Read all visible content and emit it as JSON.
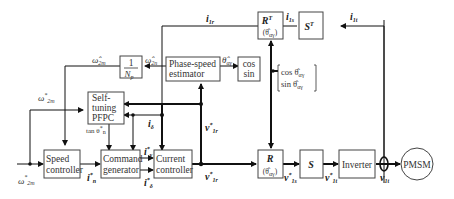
{
  "blocks": {
    "inv_np": {
      "num": "1",
      "den": "N",
      "den_sub": "p"
    },
    "phase_speed": {
      "line1": "Phase-speed",
      "line2": "estimator"
    },
    "cos_sin": {
      "line1": "cos",
      "line2": "sin"
    },
    "rt": {
      "main": "R",
      "sup": "T",
      "arg": "(θ̂",
      "arg_sub": "αγ",
      "arg_close": ")"
    },
    "st": {
      "main": "S",
      "sup": "T"
    },
    "self_tuning": {
      "line1": "Self-",
      "line2": "tuning",
      "line3": "PFPC"
    },
    "speed_ctrl": {
      "line1": "Speed",
      "line2": "controller"
    },
    "cmd_gen": {
      "line1": "Command",
      "line2": "generator"
    },
    "cur_ctrl": {
      "line1": "Current",
      "line2": "controller"
    },
    "r": {
      "main": "R",
      "arg": "(θ̂",
      "arg_sub": "αγ",
      "arg_close": ")"
    },
    "s": {
      "main": "S"
    },
    "inverter": {
      "label": "Inverter"
    },
    "pmsm": {
      "label": "PMSM"
    }
  },
  "signals": {
    "i1r_top": {
      "main": "i",
      "sub": "1r"
    },
    "i1s_top": {
      "main": "i",
      "sub": "1s"
    },
    "i1t_top": {
      "main": "i",
      "sub": "1t"
    },
    "w2m_hat": {
      "main": "ω̂",
      "sub": "2m"
    },
    "w2n_hat": {
      "main": "ω̂",
      "sub": "2n"
    },
    "theta_hat": {
      "main": "θ̂",
      "sub": "αγ"
    },
    "w2m_star_upper": {
      "main": "ω",
      "sup": "*",
      "sub": "2m"
    },
    "w2m_star_lower": {
      "main": "ω",
      "sup": "*",
      "sub": "2m"
    },
    "cos_vec": {
      "line1": "cos θ̂",
      "line1_sub": "αγ",
      "line2": "sin θ̂",
      "line2_sub": "αγ"
    },
    "tan_theta": {
      "main": "tan θ",
      "sup": "*",
      "sub": "n"
    },
    "i_delta": {
      "main": "i",
      "sub": "δ"
    },
    "v1r_star_mid": {
      "main": "v",
      "sup": "*",
      "sub": "1r"
    },
    "v1r_star_low": {
      "main": "v",
      "sup": "*",
      "sub": "1r"
    },
    "i_n_star": {
      "main": "i",
      "sup": "*",
      "sub": "n"
    },
    "i_gamma_star": {
      "main": "i",
      "sup": "*",
      "sub": "γ"
    },
    "i_delta_star": {
      "main": "i",
      "sup": "*",
      "sub": "δ"
    },
    "v1s_star": {
      "main": "v",
      "sup": "*",
      "sub": "1s"
    },
    "v1t_star": {
      "main": "v",
      "sup": "*",
      "sub": "1t"
    },
    "v1t": {
      "main": "v",
      "sub": "1t"
    }
  }
}
